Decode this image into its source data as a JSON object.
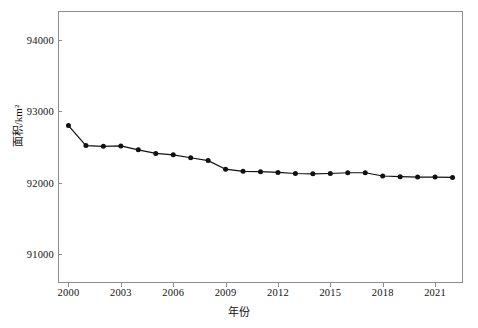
{
  "chart_data": {
    "type": "line",
    "title": "",
    "xlabel": "年份",
    "ylabel": "面积/km²",
    "x": [
      2000,
      2001,
      2002,
      2003,
      2004,
      2005,
      2006,
      2007,
      2008,
      2009,
      2010,
      2011,
      2012,
      2013,
      2014,
      2015,
      2016,
      2017,
      2018,
      2019,
      2020,
      2021,
      2022
    ],
    "values": [
      92800,
      92520,
      92510,
      92515,
      92460,
      92410,
      92390,
      92350,
      92310,
      92190,
      92160,
      92155,
      92145,
      92130,
      92125,
      92130,
      92140,
      92140,
      92095,
      92085,
      92080,
      92080,
      92075
    ],
    "series": [
      {
        "name": "面积",
        "values": [
          92800,
          92520,
          92510,
          92515,
          92460,
          92410,
          92390,
          92350,
          92310,
          92190,
          92160,
          92155,
          92145,
          92130,
          92125,
          92130,
          92140,
          92140,
          92095,
          92085,
          92080,
          92080,
          92075
        ]
      }
    ],
    "xlim": [
      1999.4,
      2022.6
    ],
    "ylim": [
      90600,
      94400
    ],
    "xticks": [
      2000,
      2003,
      2006,
      2009,
      2012,
      2015,
      2018,
      2021
    ],
    "xtick_labels": [
      "2000",
      "2003",
      "2006",
      "2009",
      "2012",
      "2015",
      "2018",
      "2021"
    ],
    "yticks": [
      91000,
      92000,
      93000,
      94000
    ],
    "ytick_labels": [
      "91000",
      "92000",
      "93000",
      "94000"
    ],
    "grid": false,
    "legend": null,
    "marker": "filled-circle",
    "line_color": "#111111",
    "marker_color": "#111111",
    "frame_color": "#8c8c8c",
    "background": "#ffffff"
  }
}
